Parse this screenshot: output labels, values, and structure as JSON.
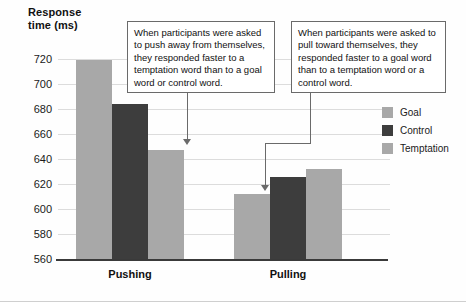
{
  "axis_title": {
    "line1": "Response",
    "line2": "time (ms)"
  },
  "chart_data": {
    "type": "bar",
    "title": "",
    "xlabel": "",
    "ylabel": "Response time (ms)",
    "ylim": [
      560,
      720
    ],
    "yticks": [
      720,
      700,
      680,
      660,
      640,
      620,
      600,
      580,
      560
    ],
    "grid": true,
    "legend_position": "right",
    "categories": [
      "Pushing",
      "Pulling"
    ],
    "series": [
      {
        "name": "Goal",
        "color": "#a8a8a8",
        "values": [
          719,
          612
        ]
      },
      {
        "name": "Control",
        "color": "#3d3d3d",
        "values": [
          684,
          626
        ]
      },
      {
        "name": "Temptation",
        "color": "#a8a8a8",
        "values": [
          647,
          632
        ]
      }
    ],
    "annotations": [
      {
        "id": "pushing-callout",
        "text": "When participants were asked to push away from themselves, they responded faster to a temptation word than to a goal word or control word.",
        "points_to": "Pushing / Temptation bar"
      },
      {
        "id": "pulling-callout",
        "text": "When participants were asked to pull toward themselves, they responded faster to a goal word than to a temptation word or a control word.",
        "points_to": "Pulling / Goal bar"
      }
    ]
  },
  "legend": {
    "items": [
      {
        "label": "Goal",
        "color": "#a8a8a8"
      },
      {
        "label": "Control",
        "color": "#3d3d3d"
      },
      {
        "label": "Temptation",
        "color": "#a8a8a8"
      }
    ]
  },
  "colors": {
    "goal": "#a8a8a8",
    "control": "#3d3d3d",
    "temptation": "#a8a8a8",
    "grid": "#dcdcdc",
    "axis": "#3a3a3a",
    "callout_border": "#6a6a6a"
  }
}
